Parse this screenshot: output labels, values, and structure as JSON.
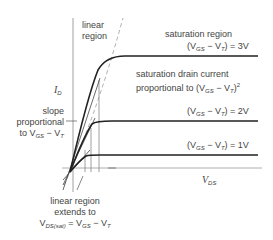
{
  "diagram": {
    "y_axis_label": {
      "symbol": "I",
      "sub": "D"
    },
    "x_axis_label": {
      "symbol": "V",
      "sub": "DS"
    },
    "linear_region_label": [
      "linear",
      "region"
    ],
    "saturation_region_label": "saturation region",
    "curves": [
      {
        "label_pre": "(V",
        "label_sub1": "GS",
        "label_mid": " − V",
        "label_sub2": "T",
        "label_post": ") = 3V",
        "value": "3V"
      },
      {
        "label_pre": "(V",
        "label_sub1": "GS",
        "label_mid": " − V",
        "label_sub2": "T",
        "label_post": ") = 2V",
        "value": "2V"
      },
      {
        "label_pre": "(V",
        "label_sub1": "GS",
        "label_mid": " − V",
        "label_sub2": "T",
        "label_post": ") = 1V",
        "value": "1V"
      }
    ],
    "saturation_current_note": {
      "line1": "saturation drain current",
      "line2_pre": "proportional to (V",
      "sub1": "GS",
      "mid": " − V",
      "sub2": "T",
      "post": ")",
      "sup": "2"
    },
    "slope_note": {
      "line1": "slope",
      "line2": "proportional",
      "line3_pre": "to V",
      "sub1": "GS",
      "mid": " − V",
      "sub2": "T"
    },
    "linear_extent_note": {
      "line1": "linear region",
      "line2": "extends to",
      "line3_pre": "V",
      "sub1": "DS(sat)",
      "mid": " = V",
      "sub2": "GS",
      "mid2": " − V",
      "sub3": "T"
    }
  }
}
